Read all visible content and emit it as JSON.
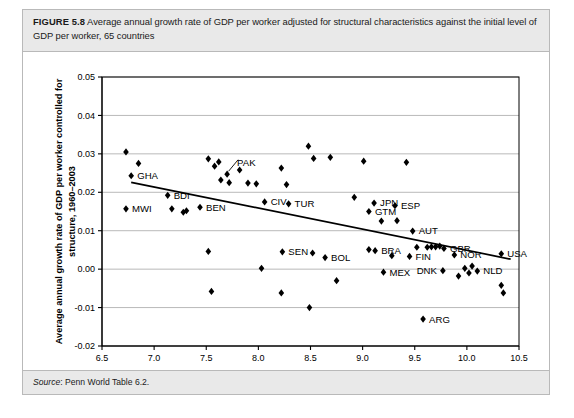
{
  "figure": {
    "number_label": "FIGURE 5.8",
    "caption": "Average annual growth rate of GDP per worker adjusted for structural characteristics against the initial level of GDP per worker, 65 countries",
    "source_label": "Source",
    "source_text": ": Penn World Table 6.2."
  },
  "chart_data": {
    "type": "scatter",
    "title": "",
    "xlabel": "Log of real GDP per worker, 1960",
    "ylabel": "Average annual growth rate of GDP per worker controlled for structure, 1960–2003",
    "xlim": [
      6.5,
      10.5
    ],
    "ylim": [
      -0.02,
      0.05
    ],
    "xticks": [
      "6.5",
      "7.0",
      "7.5",
      "8.0",
      "8.5",
      "9.0",
      "9.5",
      "10.0",
      "10.5"
    ],
    "xtick_values": [
      6.5,
      7.0,
      7.5,
      8.0,
      8.5,
      9.0,
      9.5,
      10.0,
      10.5
    ],
    "yticks": [
      "0.05",
      "0.04",
      "0.03",
      "0.02",
      "0.01",
      "0.00",
      "-0.01",
      "-0.02"
    ],
    "ytick_values": [
      0.05,
      0.04,
      0.03,
      0.02,
      0.01,
      0.0,
      -0.01,
      -0.02
    ],
    "grid": "horizontal",
    "legend": "none",
    "marker": "filled-diamond",
    "marker_color": "#000000",
    "trendline": {
      "label": "fitted regression line",
      "x": [
        6.78,
        10.42
      ],
      "y": [
        0.0226,
        0.0026
      ]
    },
    "points": [
      {
        "x": 6.73,
        "y": 0.0305,
        "label": ""
      },
      {
        "x": 6.85,
        "y": 0.0275,
        "label": ""
      },
      {
        "x": 6.78,
        "y": 0.0243,
        "label": "GHA",
        "label_pos": "right"
      },
      {
        "x": 6.73,
        "y": 0.0157,
        "label": "MWI",
        "label_pos": "right"
      },
      {
        "x": 7.13,
        "y": 0.0192,
        "label": "BDI",
        "label_pos": "right"
      },
      {
        "x": 7.17,
        "y": 0.0157,
        "label": ""
      },
      {
        "x": 7.28,
        "y": 0.0148,
        "label": ""
      },
      {
        "x": 7.31,
        "y": 0.0152,
        "label": ""
      },
      {
        "x": 7.44,
        "y": 0.0161,
        "label": "BEN",
        "label_pos": "right"
      },
      {
        "x": 7.52,
        "y": 0.0287,
        "label": ""
      },
      {
        "x": 7.62,
        "y": 0.0279,
        "label": ""
      },
      {
        "x": 7.58,
        "y": 0.0268,
        "label": ""
      },
      {
        "x": 7.7,
        "y": 0.0247,
        "label": "PAK",
        "label_pos": "upper-right"
      },
      {
        "x": 7.64,
        "y": 0.0232,
        "label": ""
      },
      {
        "x": 7.72,
        "y": 0.0225,
        "label": ""
      },
      {
        "x": 7.52,
        "y": 0.0046,
        "label": ""
      },
      {
        "x": 7.55,
        "y": -0.0058,
        "label": ""
      },
      {
        "x": 7.82,
        "y": 0.0258,
        "label": ""
      },
      {
        "x": 7.9,
        "y": 0.0224,
        "label": ""
      },
      {
        "x": 7.98,
        "y": 0.0222,
        "label": ""
      },
      {
        "x": 8.06,
        "y": 0.0175,
        "label": "CIV",
        "label_pos": "right"
      },
      {
        "x": 8.03,
        "y": 0.0002,
        "label": ""
      },
      {
        "x": 8.22,
        "y": 0.0263,
        "label": ""
      },
      {
        "x": 8.27,
        "y": 0.022,
        "label": ""
      },
      {
        "x": 8.29,
        "y": 0.017,
        "label": "TUR",
        "label_pos": "right"
      },
      {
        "x": 8.23,
        "y": 0.0045,
        "label": "SEN",
        "label_pos": "right"
      },
      {
        "x": 8.22,
        "y": -0.0062,
        "label": ""
      },
      {
        "x": 8.48,
        "y": 0.032,
        "label": ""
      },
      {
        "x": 8.53,
        "y": 0.0288,
        "label": ""
      },
      {
        "x": 8.52,
        "y": 0.0042,
        "label": ""
      },
      {
        "x": 8.49,
        "y": -0.01,
        "label": ""
      },
      {
        "x": 8.69,
        "y": 0.0291,
        "label": ""
      },
      {
        "x": 8.64,
        "y": 0.003,
        "label": "BOL",
        "label_pos": "right"
      },
      {
        "x": 8.75,
        "y": -0.003,
        "label": ""
      },
      {
        "x": 8.92,
        "y": 0.0187,
        "label": ""
      },
      {
        "x": 9.01,
        "y": 0.0281,
        "label": ""
      },
      {
        "x": 9.06,
        "y": 0.015,
        "label": "GTM",
        "label_pos": "right"
      },
      {
        "x": 9.11,
        "y": 0.0172,
        "label": "JPN",
        "label_pos": "right"
      },
      {
        "x": 9.12,
        "y": 0.0048,
        "label": "BRA",
        "label_pos": "right"
      },
      {
        "x": 9.06,
        "y": 0.0051,
        "label": ""
      },
      {
        "x": 9.18,
        "y": 0.0125,
        "label": ""
      },
      {
        "x": 9.31,
        "y": 0.0165,
        "label": "ESP",
        "label_pos": "right"
      },
      {
        "x": 9.33,
        "y": 0.0126,
        "label": ""
      },
      {
        "x": 9.28,
        "y": 0.0035,
        "label": ""
      },
      {
        "x": 9.2,
        "y": -0.0008,
        "label": "MEX",
        "label_pos": "right"
      },
      {
        "x": 9.42,
        "y": 0.0278,
        "label": ""
      },
      {
        "x": 9.48,
        "y": 0.0099,
        "label": "AUT",
        "label_pos": "right"
      },
      {
        "x": 9.52,
        "y": 0.0057,
        "label": ""
      },
      {
        "x": 9.45,
        "y": 0.0033,
        "label": "FIN",
        "label_pos": "right"
      },
      {
        "x": 9.62,
        "y": 0.0057,
        "label": ""
      },
      {
        "x": 9.66,
        "y": 0.0058,
        "label": ""
      },
      {
        "x": 9.7,
        "y": 0.0058,
        "label": ""
      },
      {
        "x": 9.74,
        "y": 0.006,
        "label": ""
      },
      {
        "x": 9.78,
        "y": 0.0054,
        "label": "GBR",
        "label_pos": "right"
      },
      {
        "x": 9.88,
        "y": 0.0037,
        "label": "NOR",
        "label_pos": "right"
      },
      {
        "x": 9.77,
        "y": -0.0004,
        "label": "DNK",
        "label_pos": "left"
      },
      {
        "x": 9.98,
        "y": 0.0002,
        "label": ""
      },
      {
        "x": 10.02,
        "y": -0.001,
        "label": ""
      },
      {
        "x": 10.05,
        "y": 0.0008,
        "label": ""
      },
      {
        "x": 10.1,
        "y": -0.0005,
        "label": "NLD",
        "label_pos": "right"
      },
      {
        "x": 10.33,
        "y": 0.004,
        "label": "USA",
        "label_pos": "right"
      },
      {
        "x": 9.58,
        "y": -0.013,
        "label": "ARG",
        "label_pos": "right"
      },
      {
        "x": 10.33,
        "y": -0.0042,
        "label": ""
      },
      {
        "x": 10.35,
        "y": -0.0062,
        "label": ""
      },
      {
        "x": 9.92,
        "y": -0.0018,
        "label": ""
      }
    ]
  }
}
